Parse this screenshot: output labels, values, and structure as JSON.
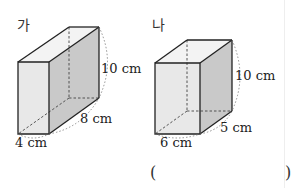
{
  "figures": [
    {
      "label": "가",
      "height": "10 cm",
      "depth": "8 cm",
      "width": "4 cm"
    },
    {
      "label": "나",
      "height": "10 cm",
      "depth": "5 cm",
      "width": "6 cm"
    }
  ],
  "answer": {
    "open_paren": "(",
    "close_paren": ")",
    "value": ""
  },
  "colors": {
    "front_face": "#e8e8e8",
    "side_face": "#c9c9c9",
    "top_face": "#f3f3f3",
    "edge": "#222222",
    "hidden_edge": "#444444"
  }
}
